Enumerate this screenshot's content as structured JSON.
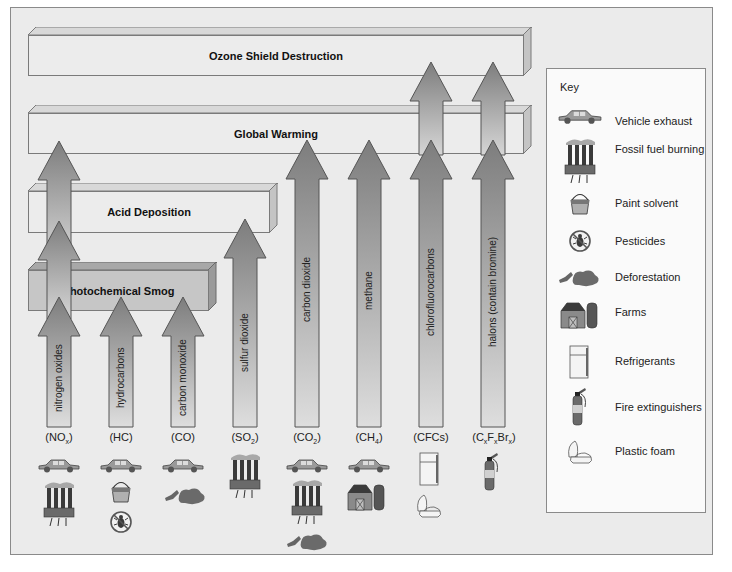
{
  "diagram": {
    "effects": [
      {
        "id": "ozone",
        "label": "Ozone Shield Destruction"
      },
      {
        "id": "warming",
        "label": "Global Warming"
      },
      {
        "id": "acid",
        "label": "Acid Deposition"
      },
      {
        "id": "smog",
        "label": "Photochemical Smog"
      }
    ],
    "pollutants": [
      {
        "name": "nitrogen oxides",
        "formula": "NO",
        "sub": "x",
        "effects": [
          "smog",
          "acid",
          "warming"
        ],
        "sources": [
          "vehicle-exhaust",
          "fossil-fuel-burning"
        ]
      },
      {
        "name": "hydrocarbons",
        "formula": "HC",
        "sub": "",
        "effects": [
          "smog"
        ],
        "sources": [
          "vehicle-exhaust",
          "paint-solvent",
          "pesticides"
        ]
      },
      {
        "name": "carbon monoxide",
        "formula": "CO",
        "sub": "",
        "effects": [
          "smog"
        ],
        "sources": [
          "vehicle-exhaust",
          "deforestation"
        ]
      },
      {
        "name": "sulfur dioxide",
        "formula": "SO",
        "sub": "2",
        "effects": [
          "acid"
        ],
        "sources": [
          "fossil-fuel-burning"
        ]
      },
      {
        "name": "carbon dioxide",
        "formula": "CO",
        "sub": "2",
        "effects": [
          "warming"
        ],
        "sources": [
          "vehicle-exhaust",
          "fossil-fuel-burning",
          "deforestation"
        ]
      },
      {
        "name": "methane",
        "formula": "CH",
        "sub": "4",
        "effects": [
          "warming"
        ],
        "sources": [
          "vehicle-exhaust",
          "farms"
        ]
      },
      {
        "name": "chlorofluorocarbons",
        "formula": "CFCs",
        "sub": "",
        "effects": [
          "warming",
          "ozone"
        ],
        "sources": [
          "refrigerants",
          "plastic-foam"
        ]
      },
      {
        "name": "halons (contain bromine)",
        "formula": "CxFxBrx",
        "sub": "",
        "effects": [
          "warming",
          "ozone"
        ],
        "sources": [
          "fire-extinguishers"
        ]
      }
    ]
  },
  "formulas": {
    "nox": {
      "main": "(NO",
      "sub": "x",
      "end": ")"
    },
    "hc": {
      "main": "(HC)"
    },
    "co": {
      "main": "(CO)"
    },
    "so2": {
      "main": "(SO",
      "sub": "2",
      "end": ")"
    },
    "co2": {
      "main": "(CO",
      "sub": "2",
      "end": ")"
    },
    "ch4": {
      "main": "(CH",
      "sub": "4",
      "end": ")"
    },
    "cfcs": {
      "main": "(CFCs)"
    },
    "halons": {
      "a": "(C",
      "s1": "x",
      "b": "F",
      "s2": "x",
      "c": "Br",
      "s3": "x",
      "d": ")"
    }
  },
  "key": {
    "title": "Key",
    "items": [
      {
        "icon": "car-icon",
        "label": "Vehicle exhaust"
      },
      {
        "icon": "factory-smokestack-icon",
        "label": "Fossil fuel burning"
      },
      {
        "icon": "paint-bucket-icon",
        "label": "Paint solvent"
      },
      {
        "icon": "no-insect-icon",
        "label": "Pesticides"
      },
      {
        "icon": "deforestation-icon",
        "label": "Deforestation"
      },
      {
        "icon": "barn-silo-icon",
        "label": "Farms"
      },
      {
        "icon": "refrigerator-icon",
        "label": "Refrigerants"
      },
      {
        "icon": "fire-extinguisher-icon",
        "label": "Fire extinguishers"
      },
      {
        "icon": "foam-container-icon",
        "label": "Plastic foam"
      }
    ]
  },
  "colors": {
    "background": "#ebebeb",
    "bar_light": "#ececec",
    "bar_dark": "#c6c6c6",
    "arrow_dark": "#7d7d7d",
    "arrow_light": "#d9d9d9",
    "border": "#7a7a7a"
  }
}
